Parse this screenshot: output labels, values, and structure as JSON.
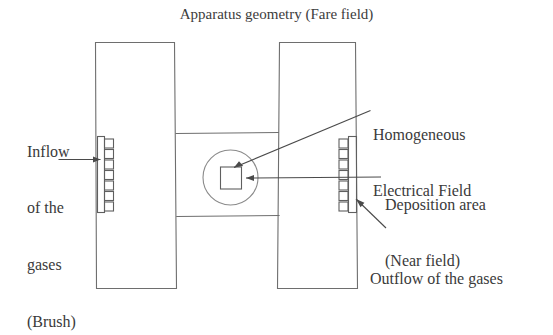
{
  "figure": {
    "title": "Apparatus geometry (Fare field)",
    "background_color": "#ffffff",
    "line_color": "#6e6e6e",
    "text_color": "#3a3a3a"
  },
  "labels": {
    "inflow": {
      "name": "Inflow of the gases (Brush)",
      "lines": [
        "Inflow",
        "of the",
        "gases",
        "(Brush)"
      ]
    },
    "homogeneous_field": {
      "name": "Homogeneous Electrical Field",
      "lines": [
        "Homogeneous",
        "Electrical Field"
      ]
    },
    "deposition_area": {
      "name": "Deposition area (Near field)",
      "lines": [
        "Deposition area",
        "(Near field)"
      ]
    },
    "outflow": {
      "name": "Outflow of the gases",
      "lines": [
        "Outflow of the gases"
      ]
    }
  },
  "diagram": {
    "left_plate": {
      "name": "left-electrode-plate"
    },
    "right_plate": {
      "name": "right-electrode-plate"
    },
    "channel": {
      "name": "horizontal-flow-channel"
    },
    "left_brush": {
      "name": "inflow-brush",
      "bristle_count": 7
    },
    "right_brush": {
      "name": "outflow-brush",
      "bristle_count": 7
    },
    "field_circle": {
      "name": "homogeneous-field-circle"
    },
    "deposition_square": {
      "name": "deposition-area-square"
    }
  }
}
